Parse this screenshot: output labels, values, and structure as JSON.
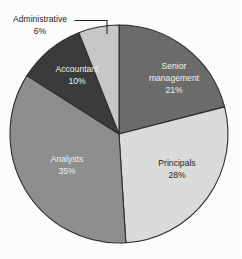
{
  "chart_data": {
    "type": "pie",
    "title": "",
    "subtitle": "",
    "xlabel": "",
    "ylabel": "",
    "legend_position": "none",
    "grid": false,
    "categories": [
      "Senior management",
      "Principals",
      "Analysts",
      "Accountant",
      "Administrative"
    ],
    "values": [
      21,
      28,
      35,
      10,
      6
    ],
    "value_unit": "%",
    "start_angle_deg": 0,
    "direction": "clockwise",
    "slices": [
      {
        "name": "senior-management",
        "label": "Senior",
        "label_line2": "management",
        "value_label": "21%",
        "value": 21,
        "color": "#6b6b6b",
        "text_color": "#f2f2f2",
        "label_placement": "inside"
      },
      {
        "name": "principals",
        "label": "Principals",
        "label_line2": "",
        "value_label": "28%",
        "value": 28,
        "color": "#dcdcdc",
        "text_color": "#1c1c1c",
        "label_placement": "inside"
      },
      {
        "name": "analysts",
        "label": "Analysts",
        "label_line2": "",
        "value_label": "35%",
        "value": 35,
        "color": "#8e8e8e",
        "text_color": "#f2f2f2",
        "label_placement": "inside"
      },
      {
        "name": "accountant",
        "label": "Accountant",
        "label_line2": "",
        "value_label": "10%",
        "value": 10,
        "color": "#3a3a3a",
        "text_color": "#f2f2f2",
        "label_placement": "inside"
      },
      {
        "name": "administrative",
        "label": "Administrative",
        "label_line2": "",
        "value_label": "6%",
        "value": 6,
        "color": "#c8c8c8",
        "text_color": "#1c1c1c",
        "label_placement": "callout"
      }
    ]
  },
  "labels": {
    "senior_management_line1": "Senior",
    "senior_management_line2": "management",
    "senior_management_value": "21%",
    "principals_name": "Principals",
    "principals_value": "28%",
    "analysts_name": "Analysts",
    "analysts_value": "35%",
    "accountant_name": "Accountant",
    "accountant_value": "10%",
    "administrative_name": "Administrative",
    "administrative_value": "6%"
  },
  "colors": {
    "senior_management": "#6b6b6b",
    "principals": "#dcdcdc",
    "analysts": "#8e8e8e",
    "accountant": "#3a3a3a",
    "administrative": "#c8c8c8",
    "outline": "#2b2b2b",
    "background": "#fefefe",
    "light_text": "#f2f2f2",
    "dark_text": "#1c1c1c"
  }
}
